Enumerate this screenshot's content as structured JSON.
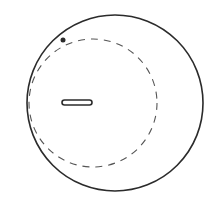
{
  "diagram": {
    "colors": {
      "stroke": "#2b2b2b",
      "dashed_stroke": "#555555",
      "background": "#ffffff"
    },
    "outer_circle": {
      "cx": 115,
      "cy": 103,
      "r": 88
    },
    "dashed_circle": {
      "cx": 93,
      "cy": 103,
      "r": 64
    },
    "dot": {
      "cx": 63,
      "cy": 40,
      "r": 2.5
    },
    "slot": {
      "x": 62,
      "y": 100,
      "width": 30,
      "height": 5
    }
  }
}
